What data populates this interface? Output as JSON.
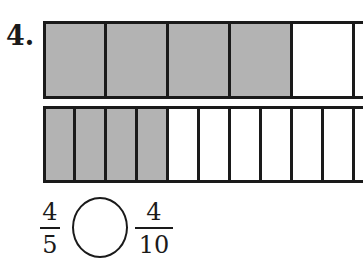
{
  "problem": {
    "number": "4.",
    "top_bar": {
      "parts": 5,
      "shaded": 4,
      "cells": [
        true,
        true,
        true,
        true,
        false
      ]
    },
    "bottom_bar": {
      "parts": 10,
      "shaded": 4,
      "cells": [
        true,
        true,
        true,
        true,
        false,
        false,
        false,
        false,
        false,
        false
      ]
    },
    "left_fraction": {
      "numerator": "4",
      "denominator": "5"
    },
    "comparison_blank": "",
    "right_fraction": {
      "numerator": "4",
      "denominator": "10"
    }
  },
  "colors": {
    "shade": "#b3b3b3",
    "line": "#1a1a1a",
    "background": "#ffffff"
  }
}
